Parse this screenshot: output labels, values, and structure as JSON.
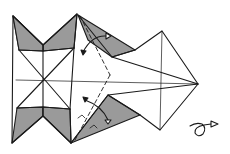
{
  "diagram": {
    "type": "origami-fold-diagram",
    "colors": {
      "line": "#1a1a1a",
      "shade": "#9a9a9a",
      "paper": "#ffffff"
    },
    "symbols": [
      {
        "name": "valley-fold-dashed-line",
        "count": 2
      },
      {
        "name": "fold-arrow",
        "count": 2
      },
      {
        "name": "right-angle-marks",
        "count": 2
      },
      {
        "name": "turn-over-symbol",
        "count": 1
      }
    ],
    "caption": "Origami step: valley-fold flaps along dashed lines, then turn the model over"
  }
}
